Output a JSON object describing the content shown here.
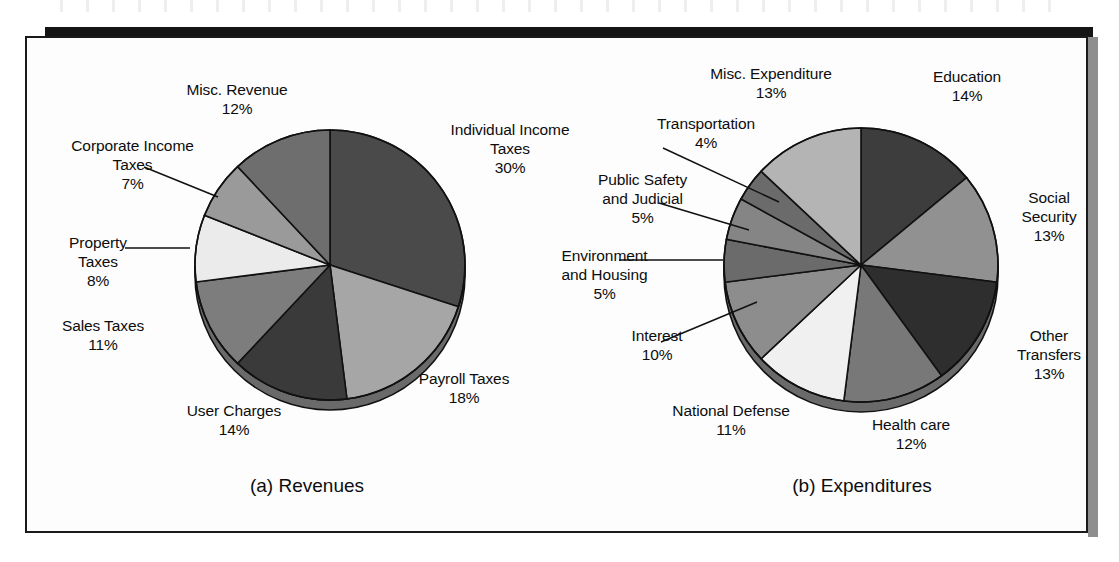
{
  "figure": {
    "background": "#fdfdfd",
    "frame_border": "#1a1a1a",
    "caption_a": "(a) Revenues",
    "caption_b": "(b) Expenditures"
  },
  "chart_data": [
    {
      "type": "pie",
      "title": "(a) Revenues",
      "start_angle_deg": 0,
      "direction": "clockwise",
      "legend": "none",
      "labels_mode": "callout",
      "categories": [
        "Individual Income Taxes",
        "Payroll Taxes",
        "User Charges",
        "Sales Taxes",
        "Property Taxes",
        "Corporate Income Taxes",
        "Misc. Revenue"
      ],
      "values": [
        30,
        18,
        14,
        11,
        8,
        7,
        12
      ],
      "value_labels": [
        "30%",
        "18%",
        "14%",
        "11%",
        "8%",
        "7%",
        "12%"
      ],
      "colors": [
        "#4a4a4a",
        "#a6a6a6",
        "#3a3a3a",
        "#7d7d7d",
        "#ebebeb",
        "#9a9a9a",
        "#6e6e6e"
      ],
      "slices": [
        {
          "name": "Individual Income Taxes",
          "pct": 30,
          "label_line1": "Individual Income",
          "label_line2": "Taxes",
          "label_line3": "30%",
          "fill": "#4a4a4a",
          "leader": false
        },
        {
          "name": "Payroll Taxes",
          "pct": 18,
          "label_line1": "Payroll Taxes",
          "label_line2": "18%",
          "label_line3": "",
          "fill": "#a6a6a6",
          "leader": false
        },
        {
          "name": "User Charges",
          "pct": 14,
          "label_line1": "User Charges",
          "label_line2": "14%",
          "label_line3": "",
          "fill": "#3a3a3a",
          "leader": false
        },
        {
          "name": "Sales Taxes",
          "pct": 11,
          "label_line1": "Sales Taxes",
          "label_line2": "11%",
          "label_line3": "",
          "fill": "#7d7d7d",
          "leader": false
        },
        {
          "name": "Property Taxes",
          "pct": 8,
          "label_line1": "Property",
          "label_line2": "Taxes",
          "label_line3": "8%",
          "fill": "#ebebeb",
          "leader": true
        },
        {
          "name": "Corporate Income Taxes",
          "pct": 7,
          "label_line1": "Corporate Income",
          "label_line2": "Taxes",
          "label_line3": "7%",
          "fill": "#9a9a9a",
          "leader": true
        },
        {
          "name": "Misc. Revenue",
          "pct": 12,
          "label_line1": "Misc. Revenue",
          "label_line2": "12%",
          "label_line3": "",
          "fill": "#6e6e6e",
          "leader": false
        }
      ]
    },
    {
      "type": "pie",
      "title": "(b) Expenditures",
      "start_angle_deg": 0,
      "direction": "clockwise",
      "legend": "none",
      "labels_mode": "callout",
      "categories": [
        "Education",
        "Social Security",
        "Other Transfers",
        "Health care",
        "National Defense",
        "Interest",
        "Environment and Housing",
        "Public Safety and Judicial",
        "Transportation",
        "Misc. Expenditure"
      ],
      "values": [
        14,
        13,
        13,
        12,
        11,
        10,
        5,
        5,
        4,
        13
      ],
      "value_labels": [
        "14%",
        "13%",
        "13%",
        "12%",
        "11%",
        "10%",
        "5%",
        "5%",
        "4%",
        "13%"
      ],
      "colors": [
        "#3d3d3d",
        "#919191",
        "#2e2e2e",
        "#787878",
        "#f0f0f0",
        "#8d8d8d",
        "#6b6b6b",
        "#858585",
        "#6b6b6b",
        "#b4b4b4"
      ],
      "slices": [
        {
          "name": "Education",
          "pct": 14,
          "label_line1": "Education",
          "label_line2": "14%",
          "label_line3": "",
          "fill": "#3d3d3d",
          "leader": false
        },
        {
          "name": "Social Security",
          "pct": 13,
          "label_line1": "Social",
          "label_line2": "Security",
          "label_line3": "13%",
          "fill": "#919191",
          "leader": false
        },
        {
          "name": "Other Transfers",
          "pct": 13,
          "label_line1": "Other",
          "label_line2": "Transfers",
          "label_line3": "13%",
          "fill": "#2e2e2e",
          "leader": false
        },
        {
          "name": "Health care",
          "pct": 12,
          "label_line1": "Health care",
          "label_line2": "12%",
          "label_line3": "",
          "fill": "#787878",
          "leader": false
        },
        {
          "name": "National Defense",
          "pct": 11,
          "label_line1": "National Defense",
          "label_line2": "11%",
          "label_line3": "",
          "fill": "#f0f0f0",
          "leader": false
        },
        {
          "name": "Interest",
          "pct": 10,
          "label_line1": "Interest",
          "label_line2": "10%",
          "label_line3": "",
          "fill": "#8d8d8d",
          "leader": true
        },
        {
          "name": "Environment and Housing",
          "pct": 5,
          "label_line1": "Environment",
          "label_line2": "and Housing",
          "label_line3": "5%",
          "fill": "#6b6b6b",
          "leader": true
        },
        {
          "name": "Public Safety and Judicial",
          "pct": 5,
          "label_line1": "Public Safety",
          "label_line2": "and Judicial",
          "label_line3": "5%",
          "fill": "#858585",
          "leader": true
        },
        {
          "name": "Transportation",
          "pct": 4,
          "label_line1": "Transportation",
          "label_line2": "4%",
          "label_line3": "",
          "fill": "#6b6b6b",
          "leader": true
        },
        {
          "name": "Misc. Expenditure",
          "pct": 13,
          "label_line1": "Misc. Expenditure",
          "label_line2": "13%",
          "label_line3": "",
          "fill": "#b4b4b4",
          "leader": false
        }
      ]
    }
  ],
  "labels_a": {
    "misc_revenue": "Misc. Revenue\n12%",
    "corporate_income_taxes": "Corporate Income\nTaxes\n7%",
    "property_taxes": "Property\nTaxes\n8%",
    "sales_taxes": "Sales Taxes\n11%",
    "user_charges": "User Charges\n14%",
    "payroll_taxes": "Payroll Taxes\n18%",
    "individual_income_taxes": "Individual Income\nTaxes\n30%"
  },
  "labels_b": {
    "misc_expenditure": "Misc. Expenditure\n13%",
    "education": "Education\n14%",
    "transportation": "Transportation\n4%",
    "public_safety": "Public Safety\nand Judicial\n5%",
    "environment_housing": "Environment\nand Housing\n5%",
    "interest": "Interest\n10%",
    "national_defense": "National Defense\n11%",
    "health_care": "Health care\n12%",
    "social_security": "Social\nSecurity\n13%",
    "other_transfers": "Other\nTransfers\n13%"
  }
}
